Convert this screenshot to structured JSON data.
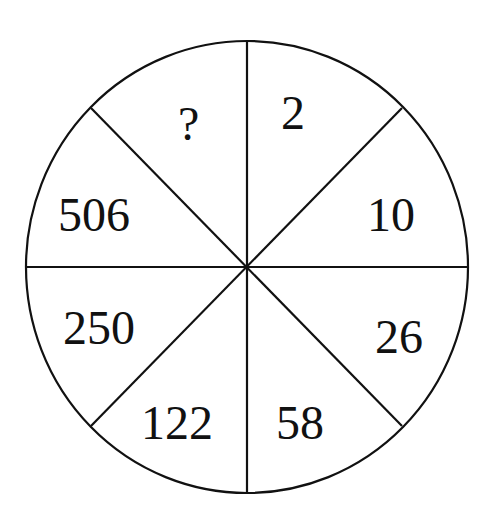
{
  "puzzle": {
    "type": "number-wheel",
    "segments": [
      {
        "position": "top-right",
        "value": "2"
      },
      {
        "position": "right-upper",
        "value": "10"
      },
      {
        "position": "right-lower",
        "value": "26"
      },
      {
        "position": "bottom-right",
        "value": "58"
      },
      {
        "position": "bottom-left",
        "value": "122"
      },
      {
        "position": "left-lower",
        "value": "250"
      },
      {
        "position": "left-upper",
        "value": "506"
      },
      {
        "position": "top-left",
        "value": "?"
      }
    ]
  },
  "colors": {
    "stroke": "#111111",
    "background": "#ffffff"
  }
}
